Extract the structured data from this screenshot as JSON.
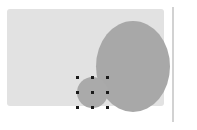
{
  "canvas": {
    "width": 197,
    "height": 130,
    "background_color": "#ffffff"
  },
  "shapes": {
    "background_rectangle": {
      "name": "background-rectangle",
      "fill_color": "#e2e2e2",
      "x": 7,
      "y": 9,
      "width": 157,
      "height": 97,
      "corner_radius": 3
    },
    "large_circle": {
      "name": "large-circle",
      "fill_color": "#a8a8a8",
      "x": 96,
      "y": 21,
      "width": 74,
      "height": 91
    },
    "small_circle": {
      "name": "small-circle-selected",
      "fill_color": "#aaaaaa",
      "x": 77,
      "y": 77,
      "width": 31,
      "height": 31,
      "selected": true
    },
    "vertical_guide": {
      "name": "vertical-guide-line",
      "stroke_color": "#d2d2d2",
      "x": 172,
      "y": 7,
      "width": 2,
      "height": 115
    }
  },
  "selection": {
    "handle_color": "#1a1a1a",
    "handle_size": 3,
    "handles": [
      {
        "id": "top-left",
        "x": 77,
        "y": 77
      },
      {
        "id": "top-center",
        "x": 92,
        "y": 77
      },
      {
        "id": "top-right",
        "x": 107,
        "y": 77
      },
      {
        "id": "middle-left",
        "x": 77,
        "y": 92
      },
      {
        "id": "middle-center",
        "x": 92,
        "y": 92
      },
      {
        "id": "middle-right",
        "x": 107,
        "y": 92
      },
      {
        "id": "bottom-left",
        "x": 77,
        "y": 107
      },
      {
        "id": "bottom-center",
        "x": 92,
        "y": 107
      },
      {
        "id": "bottom-right",
        "x": 107,
        "y": 107
      }
    ]
  }
}
